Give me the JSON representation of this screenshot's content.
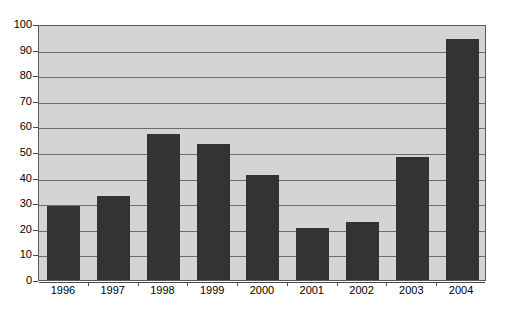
{
  "chart_data": {
    "type": "bar",
    "title": "",
    "subtitle": "",
    "xlabel": "",
    "ylabel": "",
    "categories": [
      "1996",
      "1997",
      "1998",
      "1999",
      "2000",
      "2001",
      "2002",
      "2003",
      "2004"
    ],
    "values": [
      29,
      33,
      57,
      53,
      41,
      20.5,
      22.5,
      48,
      94
    ],
    "series": [
      {
        "name": "",
        "values": [
          29,
          33,
          57,
          53,
          41,
          20.5,
          22.5,
          48,
          94
        ]
      }
    ],
    "ylim": [
      0,
      100
    ],
    "ytick_labels": [
      "0",
      "10",
      "20",
      "30",
      "40",
      "50",
      "60",
      "70",
      "80",
      "90",
      "100"
    ],
    "ytick_values": [
      0,
      10,
      20,
      30,
      40,
      50,
      60,
      70,
      80,
      90,
      100
    ],
    "ytick_step": 10,
    "grid": true,
    "grid_axis": "y",
    "legend": false,
    "legend_position": "none",
    "annotations": [],
    "colors": {
      "bar": "#333333",
      "plot_background": "#d4d4d4",
      "gridline": "#6b6b6b",
      "axis": "#4a4a4a",
      "figure_background": "#ffffff",
      "tick_label": "#000000"
    }
  }
}
